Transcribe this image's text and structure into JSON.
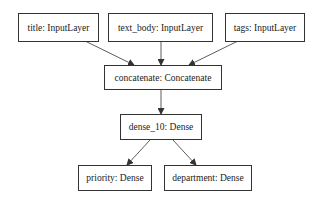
{
  "diagram": {
    "type": "keras-model-plot",
    "nodes": [
      {
        "id": "title",
        "label": "title: InputLayer"
      },
      {
        "id": "text_body",
        "label": "text_body: InputLayer"
      },
      {
        "id": "tags",
        "label": "tags: InputLayer"
      },
      {
        "id": "concatenate",
        "label": "concatenate: Concatenate"
      },
      {
        "id": "dense_10",
        "label": "dense_10: Dense"
      },
      {
        "id": "priority",
        "label": "priority: Dense"
      },
      {
        "id": "department",
        "label": "department: Dense"
      }
    ],
    "edges": [
      {
        "from": "title",
        "to": "concatenate"
      },
      {
        "from": "text_body",
        "to": "concatenate"
      },
      {
        "from": "tags",
        "to": "concatenate"
      },
      {
        "from": "concatenate",
        "to": "dense_10"
      },
      {
        "from": "dense_10",
        "to": "priority"
      },
      {
        "from": "dense_10",
        "to": "department"
      }
    ],
    "colors": {
      "stroke": "#333333",
      "background": "#ffffff",
      "text": "#222222"
    }
  }
}
